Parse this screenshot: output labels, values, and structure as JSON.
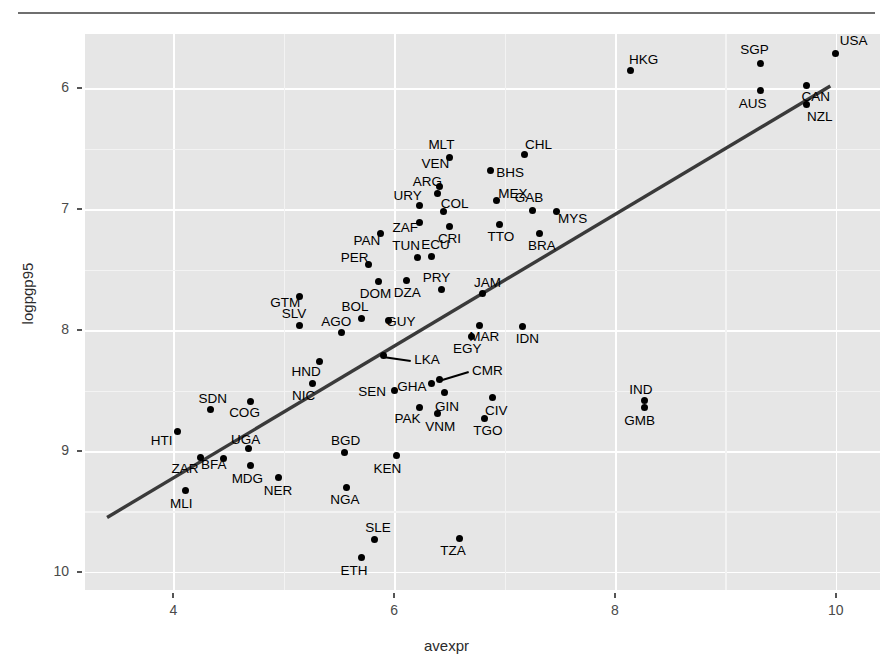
{
  "figure": {
    "xlabel": "avexpr",
    "ylabel": "logpgp95",
    "panel_bg": "#e6e6e6",
    "grid_major_color": "#ffffff",
    "point_color": "#000000",
    "fit_line_color": "#3a3a3a"
  },
  "axes": {
    "xticks": [
      "4",
      "6",
      "8",
      "10"
    ],
    "yticks": [
      "10",
      "9",
      "8",
      "7",
      "6"
    ]
  },
  "chart_data": {
    "type": "scatter",
    "title": "",
    "xlabel": "avexpr",
    "ylabel": "logpgp95",
    "xlim": [
      3.2,
      10.4
    ],
    "ylim": [
      5.85,
      10.45
    ],
    "grid": true,
    "legend": "none",
    "xticks": [
      4,
      6,
      8,
      10
    ],
    "yticks": [
      6,
      7,
      8,
      9,
      10
    ],
    "fit_line": {
      "type": "linear-regression",
      "x_start": 3.4,
      "y_start": 6.45,
      "x_end": 9.95,
      "y_end": 10.02
    },
    "point_label_field": "shortnam",
    "points": [
      {
        "label": "USA",
        "x": 10.0,
        "y": 10.29,
        "lx": 18,
        "ly": -12
      },
      {
        "label": "SGP",
        "x": 9.32,
        "y": 10.21,
        "lx": -6,
        "ly": -13
      },
      {
        "label": "HKG",
        "x": 8.14,
        "y": 10.15,
        "lx": 13,
        "ly": -10
      },
      {
        "label": "CAN",
        "x": 9.73,
        "y": 10.02,
        "lx": 10,
        "ly": 11
      },
      {
        "label": "AUS",
        "x": 9.32,
        "y": 9.98,
        "lx": -8,
        "ly": 13
      },
      {
        "label": "NZL",
        "x": 9.73,
        "y": 9.87,
        "lx": 14,
        "ly": 13
      },
      {
        "label": "CHL",
        "x": 7.18,
        "y": 9.45,
        "lx": 14,
        "ly": -10
      },
      {
        "label": "MLT",
        "x": 6.5,
        "y": 9.43,
        "lx": -8,
        "ly": -12
      },
      {
        "label": "BHS",
        "x": 6.87,
        "y": 9.32,
        "lx": 20,
        "ly": 2
      },
      {
        "label": "VEN",
        "x": 6.41,
        "y": 9.19,
        "lx": -4,
        "ly": -22
      },
      {
        "label": "ARG",
        "x": 6.39,
        "y": 9.13,
        "lx": -10,
        "ly": -12
      },
      {
        "label": "MEX",
        "x": 6.93,
        "y": 9.07,
        "lx": 16,
        "ly": -7
      },
      {
        "label": "URY",
        "x": 6.23,
        "y": 9.03,
        "lx": -12,
        "ly": -10
      },
      {
        "label": "GAB",
        "x": 7.25,
        "y": 8.99,
        "lx": -3,
        "ly": -12
      },
      {
        "label": "MYS",
        "x": 7.47,
        "y": 8.98,
        "lx": 16,
        "ly": 7
      },
      {
        "label": "COL",
        "x": 6.45,
        "y": 8.98,
        "lx": 11,
        "ly": -8
      },
      {
        "label": "ZAF",
        "x": 6.23,
        "y": 8.89,
        "lx": -14,
        "ly": 5
      },
      {
        "label": "TTO",
        "x": 6.95,
        "y": 8.87,
        "lx": 2,
        "ly": 12
      },
      {
        "label": "CRI",
        "x": 6.5,
        "y": 8.86,
        "lx": 0,
        "ly": 13
      },
      {
        "label": "BRA",
        "x": 7.32,
        "y": 8.8,
        "lx": 2,
        "ly": 13
      },
      {
        "label": "PAN",
        "x": 5.88,
        "y": 8.8,
        "lx": -14,
        "ly": 8
      },
      {
        "label": "ECU",
        "x": 6.34,
        "y": 8.61,
        "lx": 4,
        "ly": -11
      },
      {
        "label": "TUN",
        "x": 6.21,
        "y": 8.6,
        "lx": -11,
        "ly": -12
      },
      {
        "label": "PER",
        "x": 5.77,
        "y": 8.54,
        "lx": -14,
        "ly": -7
      },
      {
        "label": "DZA",
        "x": 6.11,
        "y": 8.41,
        "lx": 1,
        "ly": 12
      },
      {
        "label": "DOM",
        "x": 5.86,
        "y": 8.4,
        "lx": -3,
        "ly": 12
      },
      {
        "label": "PRY",
        "x": 6.43,
        "y": 8.34,
        "lx": -5,
        "ly": -11
      },
      {
        "label": "JAM",
        "x": 6.8,
        "y": 8.3,
        "lx": 5,
        "ly": -11
      },
      {
        "label": "GTM",
        "x": 5.14,
        "y": 8.28,
        "lx": -14,
        "ly": 7
      },
      {
        "label": "BOL",
        "x": 5.7,
        "y": 8.1,
        "lx": -6,
        "ly": -11
      },
      {
        "label": "GUY",
        "x": 5.95,
        "y": 8.08,
        "lx": 12,
        "ly": 2
      },
      {
        "label": "MAR",
        "x": 6.77,
        "y": 8.04,
        "lx": 5,
        "ly": 12
      },
      {
        "label": "SLV",
        "x": 5.14,
        "y": 8.04,
        "lx": -5,
        "ly": -11
      },
      {
        "label": "IDN",
        "x": 7.16,
        "y": 8.03,
        "lx": 5,
        "ly": 12
      },
      {
        "label": "AGO",
        "x": 5.52,
        "y": 7.98,
        "lx": -5,
        "ly": -11
      },
      {
        "label": "EGY",
        "x": 6.7,
        "y": 7.95,
        "lx": -4,
        "ly": 13
      },
      {
        "label": "LKA",
        "x": 5.9,
        "y": 7.79,
        "lx": 44,
        "ly": 4,
        "leader": true
      },
      {
        "label": "HND",
        "x": 5.32,
        "y": 7.74,
        "lx": -13,
        "ly": 10
      },
      {
        "label": "CMR",
        "x": 6.41,
        "y": 7.59,
        "lx": 48,
        "ly": -9,
        "leader": true
      },
      {
        "label": "NIC",
        "x": 5.26,
        "y": 7.56,
        "lx": -9,
        "ly": 13
      },
      {
        "label": "GHA",
        "x": 6.34,
        "y": 7.56,
        "lx": -20,
        "ly": 4
      },
      {
        "label": "SEN",
        "x": 6.0,
        "y": 7.5,
        "lx": -22,
        "ly": 1
      },
      {
        "label": "GIN",
        "x": 6.46,
        "y": 7.48,
        "lx": 2,
        "ly": 14
      },
      {
        "label": "CIV",
        "x": 6.89,
        "y": 7.44,
        "lx": 4,
        "ly": 13
      },
      {
        "label": "IND",
        "x": 8.27,
        "y": 7.42,
        "lx": -4,
        "ly": -10
      },
      {
        "label": "COG",
        "x": 4.7,
        "y": 7.41,
        "lx": -6,
        "ly": 12
      },
      {
        "label": "SDN",
        "x": 4.34,
        "y": 7.34,
        "lx": 2,
        "ly": -11
      },
      {
        "label": "GMB",
        "x": 8.27,
        "y": 7.36,
        "lx": -5,
        "ly": 14
      },
      {
        "label": "PAK",
        "x": 6.23,
        "y": 7.36,
        "lx": -12,
        "ly": 12
      },
      {
        "label": "VNM",
        "x": 6.39,
        "y": 7.31,
        "lx": 3,
        "ly": 13
      },
      {
        "label": "TGO",
        "x": 6.82,
        "y": 7.27,
        "lx": 3,
        "ly": 13
      },
      {
        "label": "HTI",
        "x": 4.04,
        "y": 7.16,
        "lx": -16,
        "ly": 9
      },
      {
        "label": "UGA",
        "x": 4.68,
        "y": 7.02,
        "lx": -3,
        "ly": -9
      },
      {
        "label": "BGD",
        "x": 5.55,
        "y": 6.99,
        "lx": 1,
        "ly": -11
      },
      {
        "label": "ZAR",
        "x": 4.25,
        "y": 6.95,
        "lx": -16,
        "ly": 12
      },
      {
        "label": "KEN",
        "x": 6.02,
        "y": 6.96,
        "lx": -9,
        "ly": 13
      },
      {
        "label": "BFA",
        "x": 4.45,
        "y": 6.94,
        "lx": -9,
        "ly": 7
      },
      {
        "label": "MDG",
        "x": 4.7,
        "y": 6.88,
        "lx": -3,
        "ly": 13
      },
      {
        "label": "NER",
        "x": 4.95,
        "y": 6.78,
        "lx": 0,
        "ly": 13
      },
      {
        "label": "MLI",
        "x": 4.11,
        "y": 6.67,
        "lx": -4,
        "ly": 13
      },
      {
        "label": "NGA",
        "x": 5.57,
        "y": 6.7,
        "lx": -2,
        "ly": 13
      },
      {
        "label": "SLE",
        "x": 5.82,
        "y": 6.27,
        "lx": 4,
        "ly": -11
      },
      {
        "label": "TZA",
        "x": 6.59,
        "y": 6.28,
        "lx": -6,
        "ly": 13
      },
      {
        "label": "ETH",
        "x": 5.7,
        "y": 6.12,
        "lx": -7,
        "ly": 14
      }
    ]
  }
}
